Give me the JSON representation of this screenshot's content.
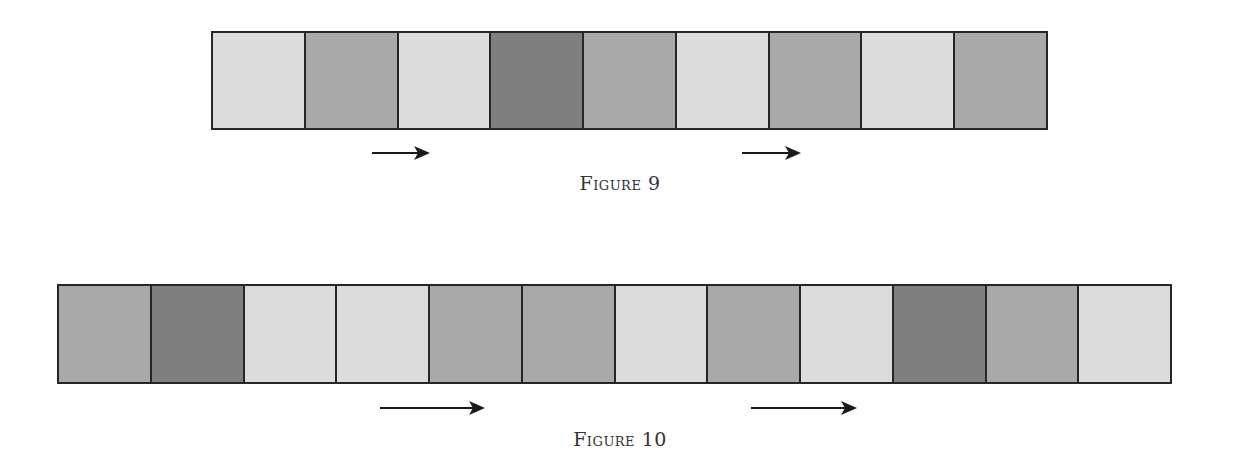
{
  "colors": {
    "light": "#dcdcdc",
    "mid": "#a9a9a9",
    "dark": "#7f7f7f",
    "border": "#262626",
    "arrow": "#1a1a1a"
  },
  "figures": [
    {
      "caption": "Figure 9",
      "cells": [
        "light",
        "mid",
        "light",
        "dark",
        "mid",
        "light",
        "mid",
        "light",
        "mid"
      ],
      "box": {
        "left": 211,
        "top": 31,
        "width": 837,
        "height": 99
      },
      "arrows": [
        {
          "left": 372,
          "top": 146,
          "width": 58
        },
        {
          "left": 742,
          "top": 146,
          "width": 59
        }
      ],
      "caption_pos": {
        "left": 540,
        "top": 172,
        "width": 160
      }
    },
    {
      "caption": "Figure 10",
      "cells": [
        "mid",
        "dark",
        "light",
        "light",
        "mid",
        "mid",
        "light",
        "mid",
        "light",
        "dark",
        "mid",
        "light"
      ],
      "box": {
        "left": 57,
        "top": 284,
        "width": 1115,
        "height": 100
      },
      "arrows": [
        {
          "left": 380,
          "top": 401,
          "width": 105
        },
        {
          "left": 751,
          "top": 401,
          "width": 106
        }
      ],
      "caption_pos": {
        "left": 530,
        "top": 428,
        "width": 180
      }
    }
  ]
}
